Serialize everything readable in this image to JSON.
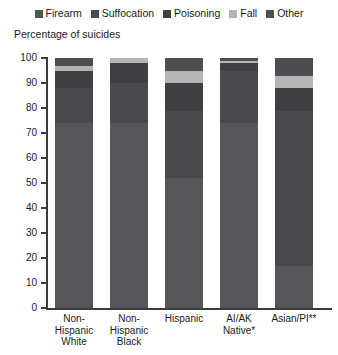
{
  "chart_data": {
    "type": "bar",
    "subtype": "stacked-bar-100-percent",
    "title": "",
    "ylabel": "Percentage of suicides",
    "xlabel": "",
    "ylim": [
      0,
      100
    ],
    "yticks": [
      0,
      10,
      20,
      30,
      40,
      50,
      60,
      70,
      80,
      90,
      100
    ],
    "grid": false,
    "legend_position": "top-center",
    "categories": [
      "Non-Hispanic White",
      "Non-Hispanic Black",
      "Hispanic",
      "AI/AK Native*",
      "Asian/PI**"
    ],
    "category_lines": [
      [
        "Non-",
        "Hispanic",
        "White"
      ],
      [
        "Non-",
        "Hispanic",
        "Black"
      ],
      [
        "Hispanic"
      ],
      [
        "AI/AK",
        "Native*"
      ],
      [
        "Asian/PI**"
      ]
    ],
    "series": [
      {
        "name": "Firearm",
        "color": "#56565a",
        "values": [
          74,
          74,
          52,
          74,
          17
        ]
      },
      {
        "name": "Suffocation",
        "color": "#4a4a4e",
        "values": [
          14,
          16,
          27,
          21,
          62
        ]
      },
      {
        "name": "Poisoning",
        "color": "#3f3f43",
        "values": [
          7,
          8,
          11,
          3,
          9
        ]
      },
      {
        "name": "Fall",
        "color": "#b4b4b4",
        "values": [
          2,
          2,
          5,
          1,
          5
        ]
      },
      {
        "name": "Other",
        "color": "#4e4e52",
        "values": [
          3,
          0,
          5,
          1,
          7
        ]
      }
    ]
  }
}
